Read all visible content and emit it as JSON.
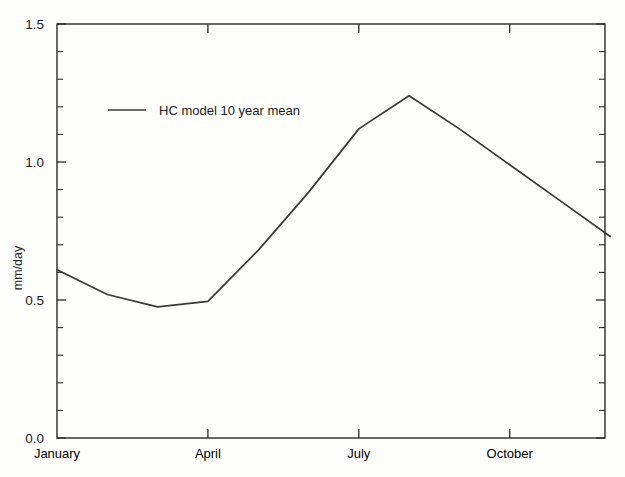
{
  "chart_data": {
    "type": "line",
    "title": "",
    "xlabel": "",
    "ylabel": "mm/day",
    "ylim": [
      0.0,
      1.5
    ],
    "grid": false,
    "legend_position": "upper-left-inside",
    "categories": [
      "January",
      "February",
      "March",
      "April",
      "May",
      "June",
      "July",
      "August",
      "September",
      "October",
      "November",
      "December"
    ],
    "x_tick_labels": [
      "January",
      "April",
      "July",
      "October"
    ],
    "x_tick_categories": [
      "January",
      "April",
      "July",
      "October"
    ],
    "y_tick_labels": [
      "0.0",
      "0.5",
      "1.0",
      "1.5"
    ],
    "y_tick_values": [
      0.0,
      0.5,
      1.0,
      1.5
    ],
    "y_minor_count_per_major": 5,
    "series": [
      {
        "name": "HC model 10 year mean",
        "values": [
          0.61,
          0.52,
          0.475,
          0.495,
          0.68,
          0.89,
          1.12,
          1.24,
          1.12,
          0.99,
          0.86,
          0.73
        ],
        "color": "#3a3a3a"
      }
    ]
  },
  "axis": {
    "y_label": "mm/day",
    "y_ticks": [
      "1.5",
      "1.0",
      "0.5",
      "0.0"
    ],
    "x_ticks": [
      "January",
      "April",
      "July",
      "October"
    ]
  },
  "legend": {
    "entries": [
      {
        "label": "HC model 10 year mean"
      }
    ]
  },
  "colors": {
    "line": "#3a3a3a",
    "axis": "#2a2a2a",
    "background": "#fdfdfc",
    "text": "#1b1b1b"
  }
}
